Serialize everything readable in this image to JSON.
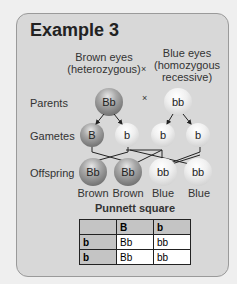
{
  "title": "Example 3",
  "parents_header": {
    "left": [
      "Brown eyes",
      "(heterozygous)"
    ],
    "cross": "×",
    "right": [
      "Blue eyes",
      "(homozygous",
      "recessive)"
    ]
  },
  "rows": {
    "parents_label": "Parents",
    "gametes_label": "Gametes",
    "offspring_label": "Offspring"
  },
  "parents": [
    {
      "genotype": "Bb",
      "shade": "dark"
    },
    {
      "genotype": "bb",
      "shade": "light"
    }
  ],
  "parents_cross": "×",
  "gametes": [
    {
      "allele": "B",
      "shade": "dark"
    },
    {
      "allele": "b",
      "shade": "light"
    },
    {
      "allele": "b",
      "shade": "light"
    },
    {
      "allele": "b",
      "shade": "light"
    }
  ],
  "offspring": [
    {
      "genotype": "Bb",
      "phenotype": "Brown",
      "shade": "dark"
    },
    {
      "genotype": "Bb",
      "phenotype": "Brown",
      "shade": "dark"
    },
    {
      "genotype": "bb",
      "phenotype": "Blue",
      "shade": "light"
    },
    {
      "genotype": "bb",
      "phenotype": "Blue",
      "shade": "light"
    }
  ],
  "punnett": {
    "title": "Punnett square",
    "header": [
      "",
      "B",
      "b"
    ],
    "rows": [
      [
        "b",
        "Bb",
        "bb"
      ],
      [
        "b",
        "Bb",
        "bb"
      ]
    ]
  }
}
